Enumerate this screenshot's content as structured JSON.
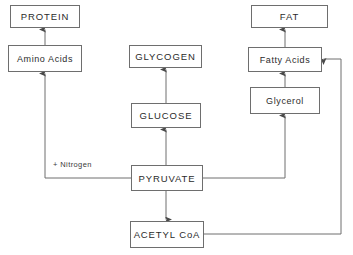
{
  "diagram": {
    "type": "flow-diagram",
    "colors": {
      "background": "#ffffff",
      "box_border": "#6e6e6e",
      "line": "#6e6e6e",
      "text": "#2b2b2b"
    },
    "nodes": [
      {
        "id": "protein",
        "label": "PROTEIN",
        "case": "upper",
        "x": 10,
        "y": 5,
        "w": 70,
        "h": 23
      },
      {
        "id": "amino",
        "label": "Amino Acids",
        "case": "mixed",
        "x": 8,
        "y": 45,
        "w": 74,
        "h": 27
      },
      {
        "id": "glycogen",
        "label": "GLYCOGEN",
        "case": "upper",
        "x": 129,
        "y": 45,
        "w": 73,
        "h": 23
      },
      {
        "id": "glucose",
        "label": "GLUCOSE",
        "case": "upper",
        "x": 131,
        "y": 103,
        "w": 70,
        "h": 25
      },
      {
        "id": "fat",
        "label": "FAT",
        "case": "upper",
        "x": 251,
        "y": 5,
        "w": 77,
        "h": 23
      },
      {
        "id": "fattyacids",
        "label": "Fatty Acids",
        "case": "mixed",
        "x": 248,
        "y": 47,
        "w": 74,
        "h": 25
      },
      {
        "id": "glycerol",
        "label": "Glycerol",
        "case": "mixed",
        "x": 250,
        "y": 87,
        "w": 70,
        "h": 27
      },
      {
        "id": "pyruvate",
        "label": "PYRUVATE",
        "case": "upper",
        "x": 131,
        "y": 165,
        "w": 72,
        "h": 26
      },
      {
        "id": "acetylcoa",
        "label": "ACETYL CoA",
        "case": "upper",
        "x": 130,
        "y": 221,
        "w": 74,
        "h": 27
      }
    ],
    "edge_labels": [
      {
        "id": "nitrogen",
        "text": "+ Nitrogen",
        "x": 52,
        "y": 160
      }
    ],
    "edges": [
      {
        "id": "amino-to-protein",
        "from": "amino",
        "to": "protein",
        "arrow": "up"
      },
      {
        "id": "pyruvate-to-amino",
        "from": "pyruvate",
        "to": "amino",
        "arrow": "up",
        "label": "+ Nitrogen"
      },
      {
        "id": "glucose-to-glycogen",
        "from": "glucose",
        "to": "glycogen",
        "arrow": "up"
      },
      {
        "id": "pyruvate-to-glucose",
        "from": "pyruvate",
        "to": "glucose",
        "arrow": "up"
      },
      {
        "id": "pyruvate-to-acetylcoa",
        "from": "pyruvate",
        "to": "acetylcoa",
        "arrow": "down"
      },
      {
        "id": "pyruvate-to-glycerol",
        "from": "pyruvate",
        "to": "glycerol",
        "arrow": "up"
      },
      {
        "id": "glycerol-to-fattyacids",
        "from": "glycerol",
        "to": "fattyacids",
        "arrow": "up"
      },
      {
        "id": "fattyacids-to-fat",
        "from": "fattyacids",
        "to": "fat",
        "arrow": "up"
      },
      {
        "id": "acetylcoa-to-fattyacids",
        "from": "acetylcoa",
        "to": "fattyacids",
        "arrow": "left"
      }
    ]
  }
}
